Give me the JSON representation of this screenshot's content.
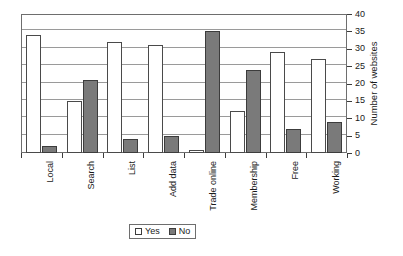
{
  "chart_data": {
    "type": "bar",
    "title": "",
    "subtitle": "",
    "xlabel": "",
    "ylabel": "Number of websites",
    "ylim": [
      0,
      40
    ],
    "ytick_step": 5,
    "yticks": [
      0,
      5,
      10,
      15,
      20,
      25,
      30,
      35,
      40
    ],
    "grid": true,
    "legend_position": "bottom-center",
    "categories": [
      "Local",
      "Search",
      "List",
      "Add data",
      "Trade online",
      "Membership",
      "Free",
      "Working"
    ],
    "series": [
      {
        "name": "Yes",
        "color": "#ffffff",
        "values": [
          34,
          15,
          32,
          31,
          1,
          12,
          29,
          27
        ]
      },
      {
        "name": "No",
        "color": "#7a7a7a",
        "values": [
          2,
          21,
          4,
          5,
          35,
          24,
          7,
          9
        ]
      }
    ],
    "annotations": []
  },
  "legend": {
    "entries": [
      {
        "label": "Yes",
        "swatch": "open-square-swatch"
      },
      {
        "label": "No",
        "swatch": "filled-square-swatch"
      }
    ]
  },
  "axis": {
    "y_title": "Number of websites",
    "y_tick_labels": [
      "0",
      "5",
      "10",
      "15",
      "20",
      "25",
      "30",
      "35",
      "40"
    ],
    "x_tick_labels": [
      "Local",
      "Search",
      "List",
      "Add data",
      "Trade online",
      "Membership",
      "Free",
      "Working"
    ]
  },
  "colors": {
    "yes_fill": "#ffffff",
    "no_fill": "#7a7a7a",
    "bar_outline": "#3c3c3c",
    "grid": "#9a9a9a",
    "frame": "#6e6e6e",
    "text": "#1a1a1a",
    "background": "#ffffff"
  }
}
